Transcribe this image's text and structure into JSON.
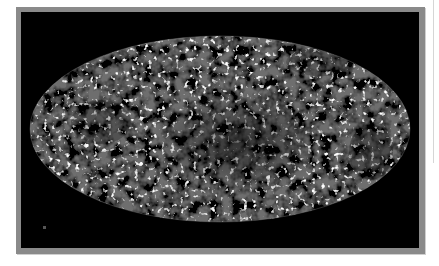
{
  "figure": {
    "kind": "full-sky map",
    "projection": "mollweide",
    "palette": {
      "background": "#000000",
      "frame": "#8a8a8a",
      "map_mid": "#6e6e6e",
      "map_dark": "#141414",
      "map_light": "#e6e6e6"
    }
  }
}
